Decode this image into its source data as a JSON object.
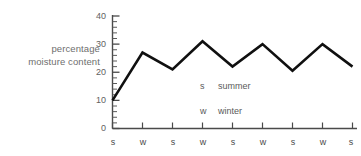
{
  "chart_data": {
    "type": "line",
    "title": "",
    "subtitle": "",
    "xlabel": "",
    "ylabel": "percentage moisture content",
    "ylabel_lines": [
      "percentage",
      "moisture content"
    ],
    "categories": [
      "s",
      "w",
      "s",
      "w",
      "s",
      "w",
      "s",
      "w",
      "s"
    ],
    "x": [
      0,
      1,
      2,
      3,
      4,
      5,
      6,
      7,
      8
    ],
    "values": [
      10,
      27,
      21,
      31,
      22,
      30,
      20.5,
      30,
      22
    ],
    "series": [
      {
        "name": "percentage moisture content",
        "values": [
          10,
          27,
          21,
          31,
          22,
          30,
          20.5,
          30,
          22
        ]
      }
    ],
    "ylim": [
      0,
      40
    ],
    "y_major_ticks": [
      0,
      10,
      20,
      30,
      40
    ],
    "y_major_tick_labels": [
      "0",
      "10",
      "20",
      "30",
      "40"
    ],
    "y_minor_tick_step": 2,
    "xlim": [
      0,
      8
    ],
    "grid": false,
    "legend_position": "inside-center",
    "line_color": "#101010",
    "axis_color": "#4a4a4a",
    "text_color": "#5f5f5f"
  },
  "legend": {
    "entries": [
      {
        "key": "s",
        "label": "summer"
      },
      {
        "key": "w",
        "label": "winter"
      }
    ]
  },
  "axis": {
    "y_labels": [
      "40",
      "30",
      "20",
      "10",
      "0"
    ],
    "x_labels": [
      "s",
      "w",
      "s",
      "w",
      "s",
      "w",
      "s",
      "w",
      "s"
    ]
  }
}
